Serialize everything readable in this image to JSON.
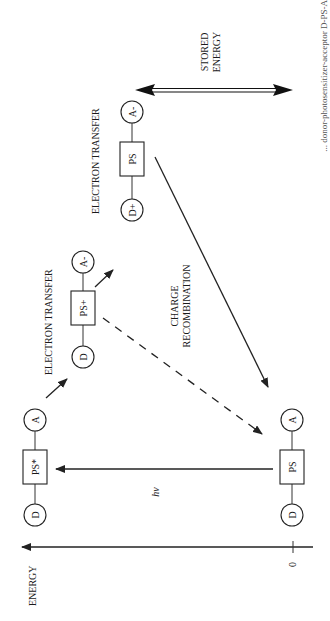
{
  "figure": {
    "orientation": "rotated 90 degrees counter-clockwise",
    "axis": {
      "label": "ENERGY",
      "zero_tick": "0"
    },
    "states": [
      {
        "id": "ground",
        "donor": "D",
        "sensitizer": "PS",
        "acceptor": "A"
      },
      {
        "id": "excited",
        "donor": "D",
        "sensitizer": "PS*",
        "acceptor": "A"
      },
      {
        "id": "charge-separated-1",
        "donor": "D",
        "sensitizer": "PS+",
        "acceptor": "A-"
      },
      {
        "id": "charge-separated-2",
        "donor": "D+",
        "sensitizer": "PS",
        "acceptor": "A-"
      }
    ],
    "labels": {
      "excitation": "hν",
      "electron_transfer_1": "ELECTRON TRANSFER",
      "electron_transfer_2": "ELECTRON TRANSFER",
      "charge_recombination_line1": "CHARGE",
      "charge_recombination_line2": "RECOMBINATION",
      "stored_energy_line1": "STORED",
      "stored_energy_line2": "ENERGY"
    },
    "caption_fragment": "... donor-photosensitizer-acceptor D-PS-A"
  }
}
